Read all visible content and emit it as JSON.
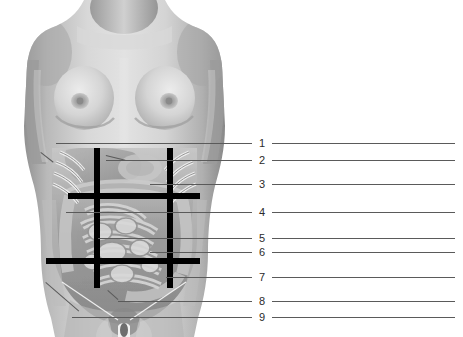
{
  "figure": {
    "background_color": "#ffffff",
    "image_description": "Grayscale anterior photograph of a female torso with superimposed abdominal viscera and a nine-region grid overlay",
    "grid": {
      "line_color": "#000000",
      "vertical_lines": 2,
      "horizontal_lines": 2,
      "region_count": 9
    },
    "leader_line_color": "#5a5a5a"
  },
  "labels": [
    {
      "number": "1",
      "y": 143,
      "pointer": true
    },
    {
      "number": "2",
      "y": 160,
      "pointer": true
    },
    {
      "number": "3",
      "y": 184,
      "pointer": true
    },
    {
      "number": "4",
      "y": 212,
      "pointer": true
    },
    {
      "number": "5",
      "y": 238,
      "pointer": true
    },
    {
      "number": "6",
      "y": 252,
      "pointer": true
    },
    {
      "number": "7",
      "y": 277,
      "pointer": true
    },
    {
      "number": "8",
      "y": 301,
      "pointer": true
    },
    {
      "number": "9",
      "y": 317,
      "pointer": true
    }
  ],
  "label_geometry": {
    "number_x": 258,
    "left_line_end": 252,
    "right_line_start": 272,
    "right_line_end": 455
  }
}
